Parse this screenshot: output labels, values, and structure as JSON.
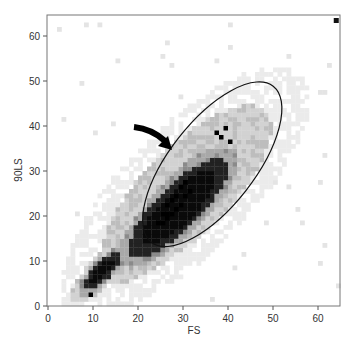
{
  "chart_data": {
    "type": "heatmap",
    "title": "",
    "xlabel": "FS",
    "ylabel": "90LS",
    "xlim": [
      0,
      65
    ],
    "ylim": [
      0,
      65
    ],
    "xticks": [
      0,
      10,
      20,
      30,
      40,
      50,
      60
    ],
    "yticks": [
      0,
      10,
      20,
      30,
      40,
      50,
      60
    ],
    "grid": false,
    "density_core": {
      "center": [
        28,
        22
      ],
      "levels": [
        "light gray",
        "mid gray",
        "dark gray",
        "black"
      ]
    },
    "annotations": [
      {
        "type": "ellipse",
        "center": [
          36.5,
          31.5
        ],
        "semi_major": 22,
        "semi_minor": 9.5,
        "angle_deg": 52,
        "label": "gate"
      },
      {
        "type": "arrow",
        "from": [
          14,
          40
        ],
        "to": [
          22,
          35
        ],
        "points_to": "ellipse gate"
      }
    ]
  },
  "axes": {
    "xlabel": "FS",
    "ylabel": "90LS",
    "xticks": [
      "0",
      "10",
      "20",
      "30",
      "40",
      "50",
      "60"
    ],
    "yticks": [
      "0",
      "10",
      "20",
      "30",
      "40",
      "50",
      "60"
    ]
  }
}
